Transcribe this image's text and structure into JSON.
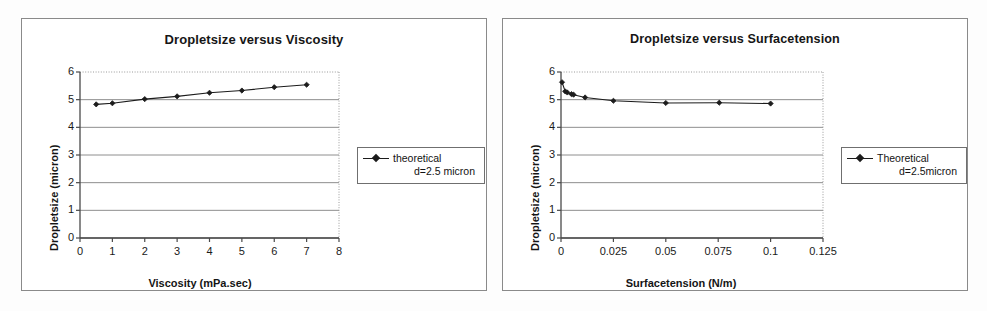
{
  "page": {
    "background_color": "#fdfdfd",
    "panel_border_color": "#8a8a8a",
    "series_color": "#1c1c1c",
    "gridline_color": "#808080"
  },
  "charts": [
    {
      "panel": "left",
      "title": "Dropletsize versus Viscosity",
      "xlabel": "Viscosity (mPa.sec)",
      "ylabel": "Dropletsize (micron)",
      "legend": {
        "line1": "theoretical",
        "line2": "d=2.5 micron"
      },
      "xticks": [
        "0",
        "1",
        "2",
        "3",
        "4",
        "5",
        "6",
        "7",
        "8"
      ],
      "yticks": [
        "0",
        "1",
        "2",
        "3",
        "4",
        "5",
        "6"
      ]
    },
    {
      "panel": "right",
      "title": "Dropletsize versus Surfacetension",
      "xlabel": "Surfacetension (N/m)",
      "ylabel": "Dropletsize (micron)",
      "legend": {
        "line1": "Theoretical",
        "line2": "d=2.5micron"
      },
      "xticks": [
        "0",
        "0.025",
        "0.05",
        "0.075",
        "0.1",
        "0.125"
      ],
      "yticks": [
        "0",
        "1",
        "2",
        "3",
        "4",
        "5",
        "6"
      ]
    }
  ],
  "chart_data": [
    {
      "type": "line",
      "title": "Dropletsize versus Viscosity",
      "xlabel": "Viscosity (mPa.sec)",
      "ylabel": "Dropletsize (micron)",
      "xlim": [
        0,
        8
      ],
      "ylim": [
        0,
        6
      ],
      "xticks": [
        0,
        1,
        2,
        3,
        4,
        5,
        6,
        7,
        8
      ],
      "yticks": [
        0,
        1,
        2,
        3,
        4,
        5,
        6
      ],
      "grid": "horizontal",
      "legend_position": "right-outside",
      "series": [
        {
          "name": "theoretical d=2.5 micron",
          "marker": "diamond",
          "x": [
            0.5,
            1.0,
            2.0,
            3.0,
            4.0,
            5.0,
            6.0,
            7.0
          ],
          "y": [
            4.83,
            4.87,
            5.02,
            5.12,
            5.25,
            5.33,
            5.45,
            5.54
          ]
        }
      ]
    },
    {
      "type": "line",
      "title": "Dropletsize versus Surfacetension",
      "xlabel": "Surfacetension (N/m)",
      "ylabel": "Dropletsize (micron)",
      "xlim": [
        0,
        0.125
      ],
      "ylim": [
        0,
        6
      ],
      "xticks": [
        0,
        0.025,
        0.05,
        0.075,
        0.1,
        0.125
      ],
      "yticks": [
        0,
        1,
        2,
        3,
        4,
        5,
        6
      ],
      "grid": "horizontal",
      "legend_position": "right-outside",
      "series": [
        {
          "name": "Theoretical d=2.5micron",
          "marker": "diamond",
          "x": [
            0.0005,
            0.002,
            0.003,
            0.005,
            0.006,
            0.0115,
            0.025,
            0.05,
            0.0755,
            0.1
          ],
          "y": [
            5.63,
            5.3,
            5.26,
            5.2,
            5.18,
            5.08,
            4.96,
            4.88,
            4.89,
            4.86
          ]
        }
      ]
    }
  ]
}
